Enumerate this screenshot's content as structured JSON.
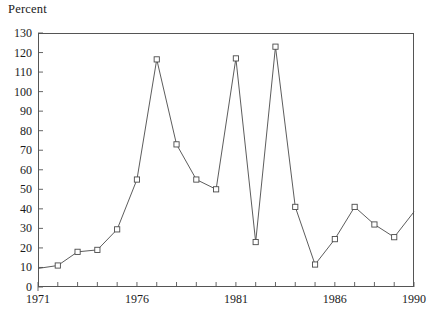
{
  "chart_data": {
    "type": "line",
    "title": "",
    "ylabel": "Percent",
    "xlabel": "",
    "ylim": [
      0,
      130
    ],
    "xlim": [
      1971,
      1990
    ],
    "grid": false,
    "legend": null,
    "marker": "open-square",
    "y_ticks": [
      0,
      10,
      20,
      30,
      40,
      50,
      60,
      70,
      80,
      90,
      100,
      110,
      120,
      130
    ],
    "y_tick_labels": [
      "0",
      "10",
      "20",
      "30",
      "40",
      "50",
      "60",
      "70",
      "80",
      "90",
      "100",
      "110",
      "120",
      "130"
    ],
    "x_ticks": [
      1971,
      1972,
      1973,
      1974,
      1975,
      1976,
      1977,
      1978,
      1979,
      1980,
      1981,
      1982,
      1983,
      1984,
      1985,
      1986,
      1987,
      1988,
      1989,
      1990
    ],
    "x_tick_labels_shown": [
      "1971",
      "1976",
      "1981",
      "1986",
      "1990"
    ],
    "x_tick_label_values": [
      1971,
      1976,
      1981,
      1986,
      1990
    ],
    "x": [
      1971,
      1972,
      1973,
      1974,
      1975,
      1976,
      1977,
      1978,
      1979,
      1980,
      1981,
      1982,
      1983,
      1984,
      1985,
      1986,
      1987,
      1988,
      1989,
      1990
    ],
    "values": [
      9.5,
      11,
      18,
      19,
      29.5,
      55,
      116.5,
      73,
      55,
      50,
      117,
      23,
      123,
      41,
      11.5,
      24.5,
      41,
      32,
      25.5,
      38.5
    ],
    "series": [
      {
        "name": "Percent",
        "values": [
          9.5,
          11,
          18,
          19,
          29.5,
          55,
          116.5,
          73,
          55,
          50,
          117,
          23,
          123,
          41,
          11.5,
          24.5,
          41,
          32,
          25.5,
          38.5
        ]
      }
    ],
    "colors": {
      "line": "#4a4a4a",
      "marker_edge": "#4a4a4a",
      "marker_face": "#ffffff",
      "axis": "#555555",
      "text": "#1a1a1a",
      "background": "#ffffff"
    }
  }
}
